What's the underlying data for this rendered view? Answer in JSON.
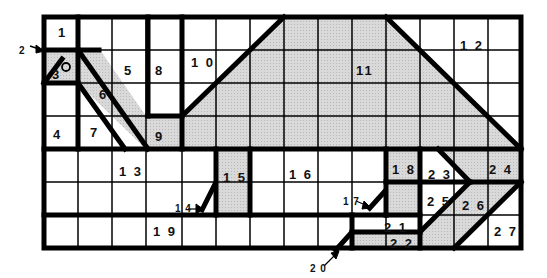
{
  "diagram": {
    "type": "numbered-region-grid",
    "grid": {
      "columns": 14,
      "rows": 7,
      "left": 44,
      "top": 17,
      "right": 521,
      "bottom": 248
    },
    "colors": {
      "shade": "#d4d4d4",
      "line": "#000000",
      "background": "#ffffff"
    },
    "regions": [
      {
        "id": "1",
        "label": "1",
        "x": 58,
        "y": 37
      },
      {
        "id": "3",
        "label": "3",
        "x": 52,
        "y": 79
      },
      {
        "id": "4",
        "label": "4",
        "x": 53,
        "y": 139
      },
      {
        "id": "5",
        "label": "5",
        "x": 124,
        "y": 75
      },
      {
        "id": "6",
        "label": "6",
        "x": 99,
        "y": 99
      },
      {
        "id": "7",
        "label": "7",
        "x": 90,
        "y": 137
      },
      {
        "id": "8",
        "label": "8",
        "x": 155,
        "y": 75
      },
      {
        "id": "9",
        "label": "9",
        "x": 155,
        "y": 141
      },
      {
        "id": "10",
        "label": "1 0",
        "x": 191,
        "y": 67
      },
      {
        "id": "11",
        "label": "11",
        "x": 356,
        "y": 75
      },
      {
        "id": "12",
        "label": "1 2",
        "x": 460,
        "y": 50
      },
      {
        "id": "13",
        "label": "1 3",
        "x": 119,
        "y": 176
      },
      {
        "id": "15",
        "label": "1 5",
        "x": 223,
        "y": 182
      },
      {
        "id": "16",
        "label": "1 6",
        "x": 289,
        "y": 179
      },
      {
        "id": "18",
        "label": "1 8",
        "x": 392,
        "y": 174
      },
      {
        "id": "19",
        "label": "1 9",
        "x": 153,
        "y": 236
      },
      {
        "id": "21",
        "label": "2 1",
        "x": 384,
        "y": 232
      },
      {
        "id": "22",
        "label": "2 2",
        "x": 390,
        "y": 248
      },
      {
        "id": "23",
        "label": "2 3",
        "x": 428,
        "y": 179
      },
      {
        "id": "24",
        "label": "2 4",
        "x": 489,
        "y": 174
      },
      {
        "id": "25",
        "label": "2 5",
        "x": 427,
        "y": 206
      },
      {
        "id": "26",
        "label": "2 6",
        "x": 462,
        "y": 210
      },
      {
        "id": "27",
        "label": "2 7",
        "x": 494,
        "y": 236
      }
    ],
    "callouts": [
      {
        "id": "2",
        "label": "2",
        "x": 19,
        "y": 54
      },
      {
        "id": "14",
        "label": "1 4",
        "x": 175,
        "y": 212
      },
      {
        "id": "17",
        "label": "1 7",
        "x": 343,
        "y": 205
      },
      {
        "id": "20",
        "label": "2 0",
        "x": 310,
        "y": 272
      }
    ],
    "marker": {
      "name": "circle-marker",
      "cx": 66,
      "cy": 67,
      "r": 4
    }
  }
}
